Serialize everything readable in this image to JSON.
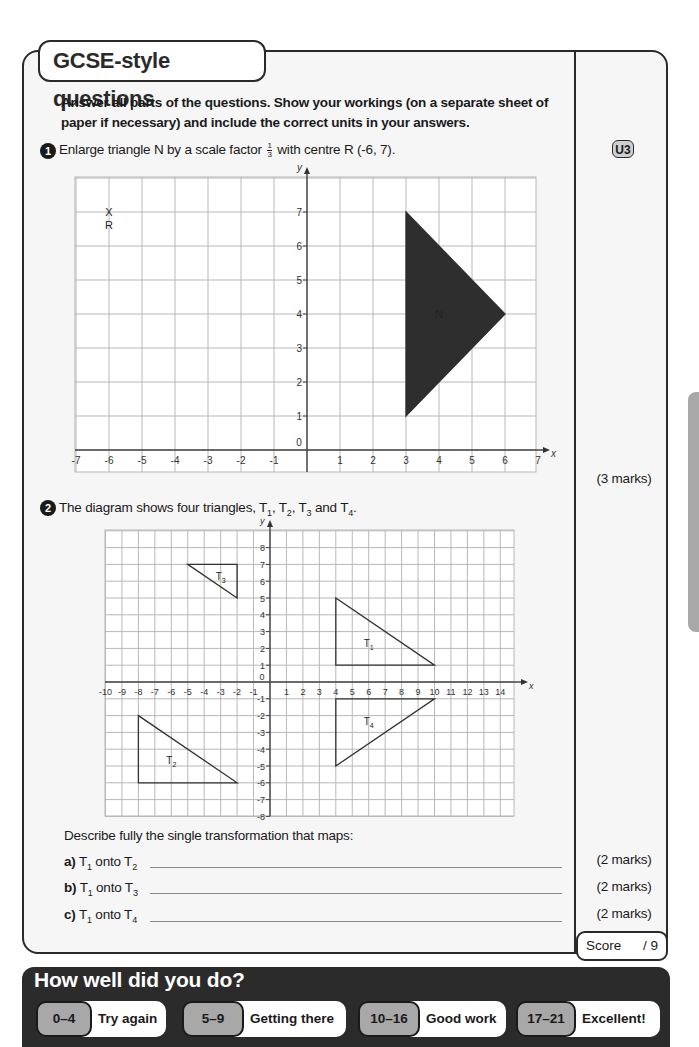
{
  "section_title": "GCSE-style questions",
  "instructions": "Answer all parts of the questions. Show your workings (on a separate sheet of paper if necessary) and include the correct units in your answers.",
  "unit_badge": "U3",
  "questions": [
    {
      "number": "1",
      "text_before": "Enlarge triangle N by a scale factor",
      "fraction": {
        "numerator": "1",
        "denominator": "3"
      },
      "text_after": "with centre R (-6, 7).",
      "marks": "(3 marks)"
    },
    {
      "number": "2",
      "text": "The diagram shows four triangles, T",
      "text_parts": [
        "The diagram shows four triangles, T",
        "1",
        ", T",
        "2",
        ", T",
        "3",
        " and T",
        "4",
        "."
      ],
      "describe": "Describe fully the single transformation that maps:",
      "parts": [
        {
          "label": "a)",
          "from": "T",
          "from_sub": "1",
          "onto": " onto T",
          "onto_sub": "2",
          "marks": "(2 marks)"
        },
        {
          "label": "b)",
          "from": "T",
          "from_sub": "1",
          "onto": " onto T",
          "onto_sub": "3",
          "marks": "(2 marks)"
        },
        {
          "label": "c)",
          "from": "T",
          "from_sub": "1",
          "onto": " onto T",
          "onto_sub": "4",
          "marks": "(2 marks)"
        }
      ]
    }
  ],
  "score": {
    "label": "Score",
    "value": "/ 9"
  },
  "feedback": {
    "title": "How well did you do?",
    "bands": [
      {
        "range": "0–4",
        "label": "Try again"
      },
      {
        "range": "5–9",
        "label": "Getting there"
      },
      {
        "range": "10–16",
        "label": "Good work"
      },
      {
        "range": "17–21",
        "label": "Excellent!"
      }
    ]
  },
  "chart_data": [
    {
      "type": "coordinate-grid",
      "title": "Question 1 grid",
      "xlabel": "x",
      "ylabel": "y",
      "xlim": [
        -7,
        7
      ],
      "ylim": [
        0,
        7
      ],
      "x_ticks": [
        "-7",
        "-6",
        "-5",
        "-4",
        "-3",
        "-2",
        "-1",
        "0",
        "1",
        "2",
        "3",
        "4",
        "5",
        "6",
        "7"
      ],
      "y_ticks": [
        "1",
        "2",
        "3",
        "4",
        "5",
        "6",
        "7"
      ],
      "points": [
        {
          "label": "R",
          "marker": "X",
          "x": -6,
          "y": 7
        }
      ],
      "shapes": [
        {
          "label": "N",
          "fill": "#2e2e2e",
          "vertices": [
            [
              3,
              7
            ],
            [
              6,
              4
            ],
            [
              3,
              1
            ]
          ]
        }
      ]
    },
    {
      "type": "coordinate-grid",
      "title": "Question 2 grid",
      "xlabel": "x",
      "ylabel": "y",
      "xlim": [
        -10,
        14
      ],
      "ylim": [
        -8,
        8
      ],
      "x_ticks": [
        "-10",
        "-9",
        "-8",
        "-7",
        "-6",
        "-5",
        "-4",
        "-3",
        "-2",
        "-1",
        "0",
        "1",
        "2",
        "3",
        "4",
        "5",
        "6",
        "7",
        "8",
        "9",
        "10",
        "11",
        "12",
        "13",
        "14"
      ],
      "y_ticks": [
        "8",
        "7",
        "6",
        "5",
        "4",
        "3",
        "2",
        "1",
        "-1",
        "-2",
        "-3",
        "-4",
        "-5",
        "-6",
        "-7",
        "-8"
      ],
      "shapes": [
        {
          "label": "T1",
          "vertices": [
            [
              4,
              5
            ],
            [
              4,
              1
            ],
            [
              10,
              1
            ]
          ]
        },
        {
          "label": "T2",
          "vertices": [
            [
              -8,
              -2
            ],
            [
              -8,
              -6
            ],
            [
              -2,
              -6
            ]
          ]
        },
        {
          "label": "T3",
          "vertices": [
            [
              -5,
              7
            ],
            [
              -2,
              7
            ],
            [
              -2,
              5
            ]
          ]
        },
        {
          "label": "T4",
          "vertices": [
            [
              4,
              -1
            ],
            [
              10,
              -1
            ],
            [
              4,
              -5
            ]
          ]
        }
      ]
    }
  ]
}
